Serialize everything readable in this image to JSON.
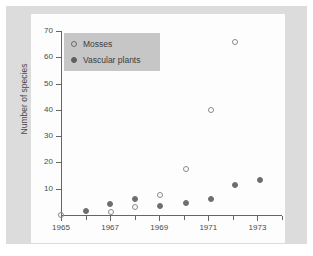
{
  "figure": {
    "background_color": "#dcdcdc",
    "panel_color": "#fdfdfd",
    "axis_color": "#666666"
  },
  "legend": {
    "position": "top-left-inside",
    "background_color": "#c6c6c6",
    "entries": [
      {
        "label": "Mosses",
        "marker": "open-circle",
        "color": "#8a8a8a"
      },
      {
        "label": "Vascular plants",
        "marker": "filled-circle",
        "color": "#6e6e6e"
      }
    ]
  },
  "chart_data": {
    "type": "scatter",
    "title": "",
    "xlabel": "",
    "ylabel": "Number of species",
    "xlim": [
      1965,
      1974
    ],
    "ylim": [
      0,
      70
    ],
    "grid": false,
    "legend_position": "upper left",
    "x_major_ticks": [
      1965,
      1967,
      1969,
      1971,
      1973
    ],
    "x_major_tick_labels": [
      "1965",
      "1967",
      "1969",
      "1971",
      "1973"
    ],
    "x_minor_ticks": [
      1966,
      1968,
      1970,
      1972,
      1974
    ],
    "y_ticks": [
      10,
      20,
      30,
      40,
      50,
      60,
      70
    ],
    "y_tick_labels": [
      "10",
      "20",
      "30",
      "40",
      "50",
      "60",
      "70"
    ],
    "series": [
      {
        "name": "Mosses",
        "marker": "open-circle",
        "color": "#8a8a8a",
        "points": [
          {
            "x": 1965.0,
            "y": 0.0
          },
          {
            "x": 1967.05,
            "y": 1.0
          },
          {
            "x": 1968.0,
            "y": 3.0
          },
          {
            "x": 1969.05,
            "y": 7.5
          },
          {
            "x": 1970.1,
            "y": 17.5
          },
          {
            "x": 1971.1,
            "y": 40.0
          },
          {
            "x": 1972.1,
            "y": 66.0
          }
        ]
      },
      {
        "name": "Vascular plants",
        "marker": "filled-circle",
        "color": "#6e6e6e",
        "points": [
          {
            "x": 1966.0,
            "y": 1.5
          },
          {
            "x": 1967.0,
            "y": 4.0
          },
          {
            "x": 1968.0,
            "y": 6.0
          },
          {
            "x": 1969.05,
            "y": 3.5
          },
          {
            "x": 1970.1,
            "y": 4.5
          },
          {
            "x": 1971.1,
            "y": 6.0
          },
          {
            "x": 1972.1,
            "y": 11.5
          },
          {
            "x": 1973.1,
            "y": 13.5
          }
        ]
      }
    ]
  }
}
